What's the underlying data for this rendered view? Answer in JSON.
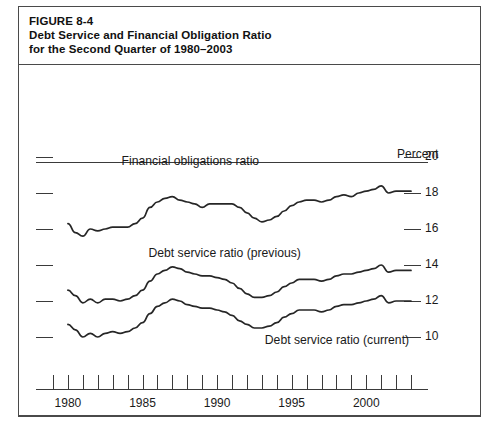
{
  "figure": {
    "number_line": "FIGURE 8-4",
    "title_line_1": "Debt Service and Financial Obligation Ratio",
    "title_line_2": "for the Second Quarter of 1980–2003"
  },
  "chart_data": {
    "type": "line",
    "title": "Debt Service and Financial Obligation Ratio for the Second Quarter of 1980–2003",
    "subtitle": "FIGURE 8-4",
    "xlabel": "",
    "ylabel": "Percent",
    "unit_label": "Percent",
    "xlim": [
      1979,
      2003
    ],
    "ylim": [
      9,
      21
    ],
    "ytick_values": [
      20,
      18,
      16,
      14,
      12,
      10
    ],
    "ytick_labels": [
      "20",
      "18",
      "16",
      "14",
      "12",
      "10"
    ],
    "xtick_values": [
      1979,
      1980,
      1981,
      1982,
      1983,
      1984,
      1985,
      1986,
      1987,
      1988,
      1989,
      1990,
      1991,
      1992,
      1993,
      1994,
      1995,
      1996,
      1997,
      1998,
      1999,
      2000,
      2001,
      2002,
      2003
    ],
    "xtick_labels_shown": [
      "1980",
      "1985",
      "1990",
      "1995",
      "2000"
    ],
    "xtick_labels_shown_values": [
      1980,
      1985,
      1990,
      1995,
      2000
    ],
    "grid": false,
    "legend_position": "inline-annotations",
    "series": [
      {
        "name": "Financial obligations ratio",
        "annotation": "Financial obligations ratio",
        "annotation_x": 1983.6,
        "annotation_y": 19.7,
        "x": [
          1980,
          1980.5,
          1981,
          1981.5,
          1982,
          1982.5,
          1983,
          1983.5,
          1984,
          1984.5,
          1985,
          1985.5,
          1986,
          1986.5,
          1987,
          1987.5,
          1988,
          1988.5,
          1989,
          1989.5,
          1990,
          1990.5,
          1991,
          1991.5,
          1992,
          1992.5,
          1993,
          1993.5,
          1994,
          1994.5,
          1995,
          1995.5,
          1996,
          1996.5,
          1997,
          1997.5,
          1998,
          1998.5,
          1999,
          1999.5,
          2000,
          2000.5,
          2001,
          2001.5,
          2002,
          2002.5,
          2003
        ],
        "y": [
          16.3,
          15.8,
          15.6,
          16.0,
          15.9,
          16.0,
          16.1,
          16.1,
          16.1,
          16.3,
          16.6,
          17.2,
          17.5,
          17.7,
          17.8,
          17.6,
          17.5,
          17.4,
          17.2,
          17.4,
          17.4,
          17.4,
          17.4,
          17.2,
          16.9,
          16.6,
          16.4,
          16.5,
          16.7,
          17.0,
          17.3,
          17.5,
          17.6,
          17.6,
          17.5,
          17.6,
          17.8,
          17.9,
          17.8,
          18.0,
          18.1,
          18.2,
          18.4,
          18.0,
          18.1,
          18.1,
          18.1
        ]
      },
      {
        "name": "Debt service ratio (previous)",
        "annotation": "Debt service ratio (previous)",
        "annotation_x": 1985.4,
        "annotation_y": 14.6,
        "x": [
          1980,
          1980.5,
          1981,
          1981.5,
          1982,
          1982.5,
          1983,
          1983.5,
          1984,
          1984.5,
          1985,
          1985.5,
          1986,
          1986.5,
          1987,
          1987.5,
          1988,
          1988.5,
          1989,
          1989.5,
          1990,
          1990.5,
          1991,
          1991.5,
          1992,
          1992.5,
          1993,
          1993.5,
          1994,
          1994.5,
          1995,
          1995.5,
          1996,
          1996.5,
          1997,
          1997.5,
          1998,
          1998.5,
          1999,
          1999.5,
          2000,
          2000.5,
          2001,
          2001.5,
          2002,
          2002.5,
          2003
        ],
        "y": [
          12.6,
          12.3,
          11.9,
          12.1,
          11.9,
          12.1,
          12.1,
          12.0,
          12.1,
          12.3,
          12.6,
          13.1,
          13.5,
          13.7,
          13.9,
          13.8,
          13.6,
          13.5,
          13.4,
          13.4,
          13.3,
          13.2,
          13.0,
          12.7,
          12.4,
          12.2,
          12.2,
          12.3,
          12.5,
          12.8,
          13.0,
          13.2,
          13.2,
          13.2,
          13.1,
          13.2,
          13.4,
          13.5,
          13.5,
          13.6,
          13.7,
          13.8,
          14.0,
          13.6,
          13.7,
          13.7,
          13.7
        ]
      },
      {
        "name": "Debt service ratio (current)",
        "annotation": "Debt service ratio (current)",
        "annotation_x": 1993.2,
        "annotation_y": 9.8,
        "x": [
          1980,
          1980.5,
          1981,
          1981.5,
          1982,
          1982.5,
          1983,
          1983.5,
          1984,
          1984.5,
          1985,
          1985.5,
          1986,
          1986.5,
          1987,
          1987.5,
          1988,
          1988.5,
          1989,
          1989.5,
          1990,
          1990.5,
          1991,
          1991.5,
          1992,
          1992.5,
          1993,
          1993.5,
          1994,
          1994.5,
          1995,
          1995.5,
          1996,
          1996.5,
          1997,
          1997.5,
          1998,
          1998.5,
          1999,
          1999.5,
          2000,
          2000.5,
          2001,
          2001.5,
          2002,
          2002.5,
          2003
        ],
        "y": [
          10.7,
          10.4,
          10.0,
          10.2,
          10.0,
          10.2,
          10.3,
          10.2,
          10.3,
          10.5,
          10.8,
          11.3,
          11.7,
          11.9,
          12.1,
          12.0,
          11.8,
          11.7,
          11.6,
          11.6,
          11.5,
          11.4,
          11.2,
          10.9,
          10.7,
          10.5,
          10.5,
          10.6,
          10.8,
          11.1,
          11.3,
          11.5,
          11.5,
          11.5,
          11.4,
          11.5,
          11.7,
          11.8,
          11.8,
          11.9,
          12.0,
          12.1,
          12.3,
          11.9,
          12.0,
          12.0,
          12.0
        ]
      }
    ]
  }
}
